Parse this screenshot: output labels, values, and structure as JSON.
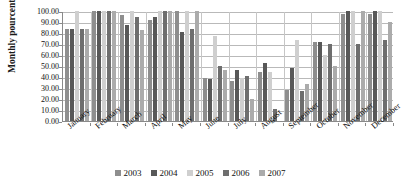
{
  "chart_data": {
    "type": "bar",
    "title": "",
    "xlabel": "",
    "ylabel": "Monthly pourcentage of IT",
    "ylim": [
      0,
      100
    ],
    "ytick_labels": [
      "100.00",
      "90.00",
      "80.00",
      "70.00",
      "60.00",
      "50.00",
      "40.00",
      "30.00",
      "20.00",
      "10.00",
      "0.00"
    ],
    "ytick_values": [
      100,
      90,
      80,
      70,
      60,
      50,
      40,
      30,
      20,
      10,
      0
    ],
    "grid": true,
    "legend_position": "bottom",
    "categories": [
      "January",
      "February",
      "March",
      "April",
      "May",
      "June",
      "July",
      "August",
      "September",
      "October",
      "November",
      "December"
    ],
    "series": [
      {
        "name": "2003",
        "color": "#8e8e8e",
        "values": [
          84,
          100,
          96,
          92,
          100,
          39,
          36,
          45,
          28,
          72,
          97,
          97
        ]
      },
      {
        "name": "2004",
        "color": "#585858",
        "values": [
          84,
          100,
          87,
          95,
          81,
          38,
          46,
          53,
          48,
          72,
          100,
          100
        ]
      },
      {
        "name": "2005",
        "color": "#cfcfcf",
        "values": [
          100,
          100,
          100,
          100,
          100,
          77,
          39,
          45,
          74,
          60,
          100,
          100
        ]
      },
      {
        "name": "2006",
        "color": "#6e6e6e",
        "values": [
          84,
          100,
          95,
          100,
          84,
          50,
          41,
          11,
          27,
          70,
          70,
          74
        ]
      },
      {
        "name": "2007",
        "color": "#ababab",
        "values": [
          84,
          100,
          83,
          100,
          100,
          46,
          20,
          0,
          34,
          50,
          100,
          90
        ]
      }
    ]
  }
}
